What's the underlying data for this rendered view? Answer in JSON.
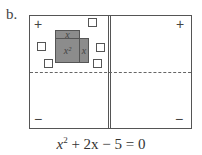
{
  "label": "b.",
  "mat": {
    "positive_sign": "+",
    "negative_sign": "−"
  },
  "tiles": {
    "x_squared": "x²",
    "x_top": "x",
    "x_side": "x",
    "unit_count": 5
  },
  "equation": {
    "base": "x",
    "exponent": "2",
    "rest": " + 2x − 5 = 0"
  },
  "colors": {
    "tile_fill": "#8c8c8c",
    "line": "#555555"
  }
}
